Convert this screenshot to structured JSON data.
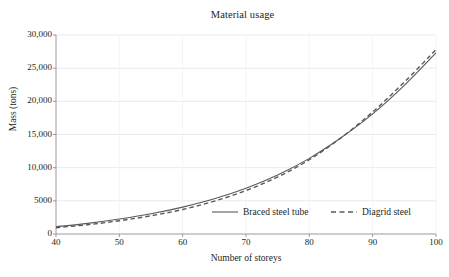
{
  "figure": {
    "background_color": "#ffffff",
    "line_color": "#58595b",
    "grid_color": "#e9e9ec",
    "axis_color": "#9a9a9e",
    "text_color": "#231f20"
  },
  "chart_data": {
    "type": "line",
    "title": "Material usage",
    "xlabel": "Number of storeys",
    "ylabel": "Mass (tons)",
    "xlim": [
      40,
      100
    ],
    "ylim": [
      0,
      30000
    ],
    "xticks": [
      40,
      50,
      60,
      70,
      80,
      90,
      100
    ],
    "xtick_labels": [
      "40",
      "50",
      "60",
      "70",
      "80",
      "90",
      "100"
    ],
    "yticks": [
      0,
      5000,
      10000,
      15000,
      20000,
      25000,
      30000
    ],
    "ytick_labels": [
      "0",
      "5000",
      "10,000",
      "15,000",
      "20,000",
      "25,000",
      "30,000"
    ],
    "grid": true,
    "legend_position": "lower center",
    "x": [
      40,
      45,
      50,
      55,
      60,
      65,
      70,
      75,
      80,
      85,
      90,
      95,
      100
    ],
    "series": [
      {
        "name": "Braced steel tube",
        "style": "solid",
        "color": "#58595b",
        "values": [
          1100,
          1600,
          2250,
          3050,
          4050,
          5300,
          6900,
          8900,
          11400,
          14500,
          18100,
          22400,
          27300
        ]
      },
      {
        "name": "Diagrid steel",
        "style": "dashed",
        "color": "#58595b",
        "values": [
          950,
          1400,
          2000,
          2750,
          3700,
          4950,
          6550,
          8600,
          11200,
          14500,
          18400,
          22900,
          27800
        ]
      }
    ]
  },
  "legend": {
    "items": [
      {
        "label": "Braced steel tube",
        "style": "solid"
      },
      {
        "label": "Diagrid steel",
        "style": "dashed"
      }
    ]
  }
}
